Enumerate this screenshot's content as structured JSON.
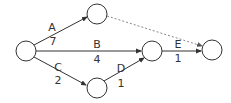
{
  "diagram": {
    "type": "activity-on-arrow network",
    "nodes": [
      {
        "id": "n1",
        "cx": 26,
        "cy": 51,
        "r": 10
      },
      {
        "id": "n2",
        "cx": 97,
        "cy": 14,
        "r": 10
      },
      {
        "id": "n3",
        "cx": 97,
        "cy": 88,
        "r": 10
      },
      {
        "id": "n4",
        "cx": 152,
        "cy": 51,
        "r": 10
      },
      {
        "id": "n5",
        "cx": 212,
        "cy": 50,
        "r": 10
      }
    ],
    "edges": [
      {
        "from": "n1",
        "to": "n2",
        "activity": "A",
        "duration": "7",
        "style": "solid"
      },
      {
        "from": "n1",
        "to": "n4",
        "activity": "B",
        "duration": "4",
        "style": "solid"
      },
      {
        "from": "n1",
        "to": "n3",
        "activity": "C",
        "duration": "2",
        "style": "solid"
      },
      {
        "from": "n3",
        "to": "n4",
        "activity": "D",
        "duration": "1",
        "style": "solid"
      },
      {
        "from": "n4",
        "to": "n5",
        "activity": "E",
        "duration": "1",
        "style": "solid"
      },
      {
        "from": "n2",
        "to": "n5",
        "activity": "",
        "duration": "",
        "style": "dashed"
      }
    ],
    "labels": {
      "A": "A",
      "A_dur": "7",
      "B": "B",
      "B_dur": "4",
      "C": "C",
      "C_dur": "2",
      "D": "D",
      "D_dur": "1",
      "E": "E",
      "E_dur": "1"
    },
    "colors": {
      "stroke": "#333333",
      "dashed": "#888888",
      "background": "#ffffff"
    }
  }
}
